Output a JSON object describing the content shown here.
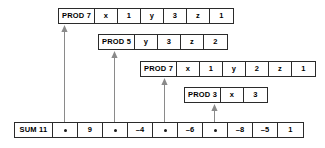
{
  "diagram": {
    "colors": {
      "border": "#2b2b2b",
      "text": "#000000",
      "background": "#ffffff",
      "arrow": "#8a8a8a",
      "dot": "#1a1a1a"
    },
    "rows": [
      {
        "id": "prod-row-1",
        "header": "PROD 7",
        "left": 58,
        "top": 8,
        "head_width": 36,
        "cell_width": 23,
        "cells": [
          {
            "text": "x"
          },
          {
            "text": "1"
          },
          {
            "text": "y"
          },
          {
            "text": "3"
          },
          {
            "text": "z"
          },
          {
            "text": "1"
          }
        ]
      },
      {
        "id": "prod-row-2",
        "header": "PROD 5",
        "left": 98,
        "top": 34,
        "head_width": 36,
        "cell_width": 23,
        "cells": [
          {
            "text": "y"
          },
          {
            "text": "3"
          },
          {
            "text": "z"
          },
          {
            "text": "2"
          }
        ]
      },
      {
        "id": "prod-row-3",
        "header": "PROD 7",
        "left": 140,
        "top": 61,
        "head_width": 36,
        "cell_width": 23,
        "cells": [
          {
            "text": "x"
          },
          {
            "text": "1"
          },
          {
            "text": "y"
          },
          {
            "text": "2"
          },
          {
            "text": "z"
          },
          {
            "text": "1"
          }
        ]
      },
      {
        "id": "prod-row-4",
        "header": "PROD 3",
        "left": 184,
        "top": 87,
        "head_width": 36,
        "cell_width": 23,
        "cells": [
          {
            "text": "x"
          },
          {
            "text": "3"
          }
        ]
      }
    ],
    "sum_row": {
      "id": "sum-row",
      "header": "SUM 11",
      "left": 14,
      "top": 122,
      "head_width": 38,
      "cell_width": 25,
      "cells": [
        {
          "text": "",
          "kind": "pointer"
        },
        {
          "text": "9",
          "kind": "value"
        },
        {
          "text": "",
          "kind": "pointer"
        },
        {
          "text": "–4",
          "kind": "value"
        },
        {
          "text": "",
          "kind": "pointer"
        },
        {
          "text": "–6",
          "kind": "value"
        },
        {
          "text": "",
          "kind": "pointer"
        },
        {
          "text": "–8",
          "kind": "value"
        },
        {
          "text": "–5",
          "kind": "value"
        },
        {
          "text": "1",
          "kind": "value"
        }
      ]
    },
    "arrows": [
      {
        "id": "arrow-1",
        "from_cell": 0,
        "x": 64,
        "y_bottom": 122,
        "y_top": 25,
        "target": "prod-row-1"
      },
      {
        "id": "arrow-2",
        "from_cell": 2,
        "x": 114,
        "y_bottom": 122,
        "y_top": 51,
        "target": "prod-row-2"
      },
      {
        "id": "arrow-3",
        "from_cell": 4,
        "x": 164,
        "y_bottom": 122,
        "y_top": 78,
        "target": "prod-row-3"
      },
      {
        "id": "arrow-4",
        "from_cell": 6,
        "x": 214,
        "y_bottom": 122,
        "y_top": 104,
        "target": "prod-row-4"
      }
    ]
  }
}
